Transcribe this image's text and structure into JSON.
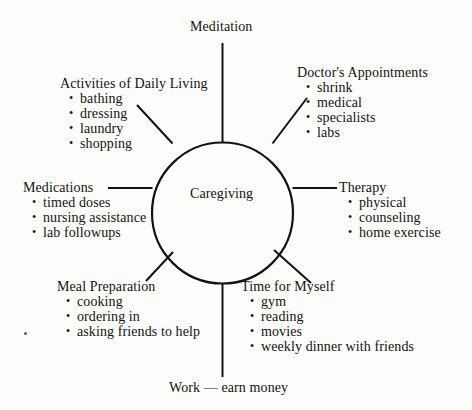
{
  "diagram": {
    "title": "Caregiving",
    "center_label": "Caregiving",
    "type": "hub-and-spoke mind map",
    "ink_color": "#121212",
    "background_color": "#fdfdfc",
    "plain_labels": {
      "top": "Meditation",
      "bottom": "Work — earn money"
    },
    "branches": [
      {
        "id": "activities-of-daily-living",
        "title": "Activities of Daily Living",
        "items": [
          "bathing",
          "dressing",
          "laundry",
          "shopping"
        ]
      },
      {
        "id": "doctors-appointments",
        "title": "Doctor's Appointments",
        "items": [
          "shrink",
          "medical",
          "specialists",
          "labs"
        ]
      },
      {
        "id": "medications",
        "title": "Medications",
        "items": [
          "timed doses",
          "nursing assistance",
          "lab followups"
        ]
      },
      {
        "id": "therapy",
        "title": "Therapy",
        "items": [
          "physical",
          "counseling",
          "home exercise"
        ]
      },
      {
        "id": "meal-preparation",
        "title": "Meal Preparation",
        "items": [
          "cooking",
          "ordering in",
          "asking friends to help"
        ]
      },
      {
        "id": "time-for-myself",
        "title": "Time for Myself",
        "items": [
          "gym",
          "reading",
          "movies",
          "weekly dinner with friends"
        ]
      }
    ]
  }
}
